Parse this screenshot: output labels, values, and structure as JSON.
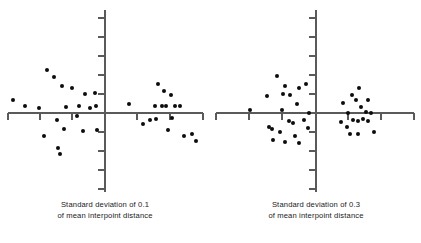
{
  "figure": {
    "title": "",
    "background_color": "#ffffff",
    "point_color": "#0c0c0c",
    "axis_color": "#5a5a5a"
  },
  "panels": [
    {
      "id": "left",
      "caption_line1": "Standard deviation of 0.1",
      "caption_line2": "of mean interpoint distance"
    },
    {
      "id": "right",
      "caption_line1": "Standard deviation of 0.3",
      "caption_line2": "of mean interpoint distance"
    }
  ],
  "chart_data": [
    {
      "type": "scatter",
      "title": "Standard deviation of 0.1 of mean interpoint distance",
      "xlabel": "",
      "ylabel": "",
      "grid": false,
      "legend": "none",
      "axes": {
        "origin_px": [
          105,
          113
        ],
        "x_axis_span_px": [
          8,
          203
        ],
        "y_axis_span_px": [
          10,
          192
        ],
        "x_ticks_px": [
          8,
          40,
          72,
          105,
          137,
          170,
          203
        ],
        "y_ticks_px": [
          18,
          37,
          56,
          75,
          94,
          113,
          132,
          151,
          170,
          189
        ],
        "tick_direction": "outward",
        "xlim": [
          -3,
          3
        ],
        "ylim": [
          -3,
          3
        ]
      },
      "n_points": 38,
      "points_px": [
        [
          13,
          100
        ],
        [
          25,
          106
        ],
        [
          39,
          108
        ],
        [
          57,
          120
        ],
        [
          47,
          70
        ],
        [
          54,
          77
        ],
        [
          62,
          86
        ],
        [
          66,
          107
        ],
        [
          72,
          88
        ],
        [
          79,
          106
        ],
        [
          77,
          116
        ],
        [
          85,
          94
        ],
        [
          90,
          108
        ],
        [
          95,
          93
        ],
        [
          96,
          106
        ],
        [
          83,
          131
        ],
        [
          97,
          130
        ],
        [
          64,
          129
        ],
        [
          44,
          136
        ],
        [
          58,
          148
        ],
        [
          60,
          154
        ],
        [
          129,
          104
        ],
        [
          158,
          84
        ],
        [
          164,
          91
        ],
        [
          166,
          106
        ],
        [
          171,
          95
        ],
        [
          175,
          106
        ],
        [
          155,
          106
        ],
        [
          162,
          106
        ],
        [
          180,
          106
        ],
        [
          150,
          120
        ],
        [
          156,
          119
        ],
        [
          143,
          124
        ],
        [
          172,
          118
        ],
        [
          168,
          130
        ],
        [
          184,
          136
        ],
        [
          192,
          134
        ],
        [
          196,
          141
        ]
      ],
      "points_data": [
        [
          -2.83,
          0.4
        ],
        [
          -2.46,
          0.22
        ],
        [
          -2.03,
          0.15
        ],
        [
          -1.48,
          -0.22
        ],
        [
          -1.78,
          1.32
        ],
        [
          -1.57,
          1.11
        ],
        [
          -1.32,
          0.83
        ],
        [
          -1.2,
          0.18
        ],
        [
          -1.02,
          0.77
        ],
        [
          -0.8,
          0.22
        ],
        [
          -0.86,
          -0.09
        ],
        [
          -0.62,
          0.58
        ],
        [
          -0.46,
          0.15
        ],
        [
          -0.31,
          0.62
        ],
        [
          -0.28,
          0.22
        ],
        [
          -0.68,
          -0.55
        ],
        [
          -0.25,
          -0.52
        ],
        [
          -1.26,
          -0.49
        ],
        [
          -1.88,
          -0.71
        ],
        [
          -1.45,
          -1.08
        ],
        [
          -1.38,
          -1.26
        ],
        [
          0.74,
          0.28
        ],
        [
          1.63,
          0.89
        ],
        [
          1.82,
          0.68
        ],
        [
          1.88,
          0.22
        ],
        [
          2.03,
          0.55
        ],
        [
          2.15,
          0.22
        ],
        [
          1.54,
          0.22
        ],
        [
          1.75,
          0.22
        ],
        [
          2.31,
          0.22
        ],
        [
          1.38,
          -0.22
        ],
        [
          1.57,
          -0.18
        ],
        [
          1.17,
          -0.34
        ],
        [
          2.06,
          -0.15
        ],
        [
          1.94,
          -0.52
        ],
        [
          2.43,
          -0.71
        ],
        [
          2.68,
          -0.65
        ],
        [
          2.8,
          -0.86
        ]
      ]
    },
    {
      "type": "scatter",
      "title": "Standard deviation of 0.3 of mean interpoint distance",
      "xlabel": "",
      "ylabel": "",
      "grid": false,
      "legend": "none",
      "axes": {
        "origin_px": [
          105,
          113
        ],
        "x_axis_span_px": [
          5,
          203
        ],
        "y_axis_span_px": [
          10,
          192
        ],
        "x_ticks_px": [
          5,
          38,
          71,
          105,
          137,
          170,
          203
        ],
        "y_ticks_px": [
          18,
          37,
          56,
          75,
          94,
          113,
          132,
          151,
          170,
          189
        ],
        "tick_direction": "outward",
        "xlim": [
          -3,
          3
        ],
        "ylim": [
          -3,
          3
        ]
      },
      "n_points": 40,
      "points_px": [
        [
          39,
          110
        ],
        [
          56,
          96
        ],
        [
          66,
          76
        ],
        [
          74,
          86
        ],
        [
          79,
          95
        ],
        [
          88,
          88
        ],
        [
          71,
          110
        ],
        [
          78,
          121
        ],
        [
          86,
          104
        ],
        [
          93,
          120
        ],
        [
          98,
          113
        ],
        [
          58,
          127
        ],
        [
          69,
          132
        ],
        [
          62,
          140
        ],
        [
          74,
          142
        ],
        [
          84,
          136
        ],
        [
          88,
          143
        ],
        [
          97,
          128
        ],
        [
          95,
          84
        ],
        [
          82,
          123
        ],
        [
          72,
          94
        ],
        [
          61,
          129
        ],
        [
          132,
          103
        ],
        [
          137,
          113
        ],
        [
          141,
          95
        ],
        [
          145,
          100
        ],
        [
          148,
          88
        ],
        [
          150,
          107
        ],
        [
          155,
          112
        ],
        [
          157,
          100
        ],
        [
          160,
          113
        ],
        [
          130,
          122
        ],
        [
          136,
          127
        ],
        [
          142,
          120
        ],
        [
          147,
          121
        ],
        [
          152,
          119
        ],
        [
          157,
          121
        ],
        [
          139,
          134
        ],
        [
          147,
          134
        ],
        [
          163,
          132
        ]
      ],
      "points_data": [
        [
          -2.03,
          0.09
        ],
        [
          -1.51,
          0.52
        ],
        [
          -1.2,
          1.14
        ],
        [
          -0.95,
          0.83
        ],
        [
          -0.8,
          0.55
        ],
        [
          -0.52,
          0.77
        ],
        [
          -1.05,
          0.09
        ],
        [
          -0.83,
          -0.25
        ],
        [
          -0.58,
          0.28
        ],
        [
          -0.37,
          -0.22
        ],
        [
          -0.22,
          0.0
        ],
        [
          -1.45,
          -0.43
        ],
        [
          -1.11,
          -0.58
        ],
        [
          -1.32,
          -0.83
        ],
        [
          -0.95,
          -0.89
        ],
        [
          -0.65,
          -0.71
        ],
        [
          -0.52,
          -0.92
        ],
        [
          -0.25,
          -0.46
        ],
        [
          -0.31,
          0.89
        ],
        [
          -0.71,
          -0.31
        ],
        [
          -1.02,
          0.58
        ],
        [
          -1.35,
          -0.49
        ],
        [
          0.83,
          0.31
        ],
        [
          0.98,
          0.0
        ],
        [
          1.11,
          0.55
        ],
        [
          1.23,
          0.4
        ],
        [
          1.32,
          0.77
        ],
        [
          1.38,
          0.18
        ],
        [
          1.54,
          0.03
        ],
        [
          1.6,
          0.4
        ],
        [
          1.69,
          0.0
        ],
        [
          0.77,
          -0.28
        ],
        [
          0.95,
          -0.43
        ],
        [
          1.14,
          -0.22
        ],
        [
          1.29,
          -0.25
        ],
        [
          1.45,
          -0.18
        ],
        [
          1.6,
          -0.25
        ],
        [
          1.05,
          -0.65
        ],
        [
          1.29,
          -0.65
        ],
        [
          1.78,
          -0.58
        ]
      ]
    }
  ]
}
